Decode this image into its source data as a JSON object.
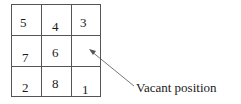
{
  "puzzle": {
    "title": "8-puzzle state",
    "cells": [
      {
        "row": 0,
        "col": 0,
        "value": "5"
      },
      {
        "row": 0,
        "col": 1,
        "value": "4"
      },
      {
        "row": 0,
        "col": 2,
        "value": "3"
      },
      {
        "row": 1,
        "col": 0,
        "value": "7"
      },
      {
        "row": 1,
        "col": 1,
        "value": "6"
      },
      {
        "row": 1,
        "col": 2,
        "value": ""
      },
      {
        "row": 2,
        "col": 0,
        "value": "2"
      },
      {
        "row": 2,
        "col": 1,
        "value": "8"
      },
      {
        "row": 2,
        "col": 2,
        "value": "1"
      }
    ]
  },
  "annotation": {
    "label": "Vacant position",
    "points_to": {
      "row": 1,
      "col": 2
    }
  }
}
